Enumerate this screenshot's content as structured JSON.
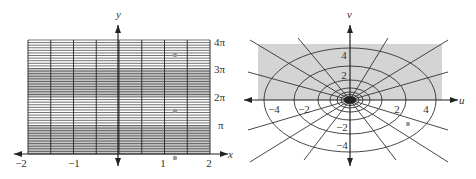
{
  "left_plot": {
    "axis_x_label": "x",
    "axis_y_label": "y",
    "x_ticks": [
      {
        "label": "−2",
        "value": -2
      },
      {
        "label": "−1",
        "value": -1
      },
      {
        "label": "1",
        "value": 1
      },
      {
        "label": "2",
        "value": 2
      }
    ],
    "y_ticks": [
      {
        "label": "π",
        "value": 1
      },
      {
        "label": "2π",
        "value": 2
      },
      {
        "label": "3π",
        "value": 3
      },
      {
        "label": "4π",
        "value": 4
      }
    ],
    "x_range": [
      -2,
      2
    ],
    "y_range": [
      "0",
      "4π"
    ],
    "vertical_grid_count": 9,
    "horizontal_lines_per_pi": 11,
    "shaded_bands": [
      [
        "0",
        "π"
      ],
      [
        "2π",
        "3π"
      ]
    ],
    "marked_points": [
      {
        "x": 1.25,
        "y": "3.5π"
      },
      {
        "x": 1.25,
        "y": "1.5π"
      },
      {
        "x": 1.25,
        "y": "-0.2π"
      }
    ],
    "colors": {
      "shade": "#c8c8c8",
      "line": "#333333",
      "point": "#9a9a9a"
    }
  },
  "right_plot": {
    "axis_u_label": "u",
    "axis_v_label": "v",
    "u_ticks": [
      {
        "label": "−4",
        "value": -4
      },
      {
        "label": "−2",
        "value": -2
      },
      {
        "label": "2",
        "value": 2
      },
      {
        "label": "4",
        "value": 4
      }
    ],
    "v_ticks": [
      {
        "label": "4",
        "value": 4
      },
      {
        "label": "2",
        "value": 2
      },
      {
        "label": "−2",
        "value": -2
      },
      {
        "label": "−4",
        "value": -4
      }
    ],
    "ellipse_count": 7,
    "ray_count": 16,
    "shaded_region": "upper half-plane rectangle",
    "marked_points": [
      {
        "u": 3.2,
        "v": -1.6
      }
    ],
    "colors": {
      "shade": "#d4d4d4",
      "line": "#333333",
      "point": "#9a9a9a"
    }
  }
}
